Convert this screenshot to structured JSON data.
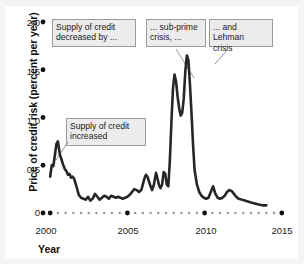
{
  "chart_data": {
    "type": "line",
    "title": "",
    "xlabel": "Year",
    "ylabel": "Price of credit risk (percent per year)",
    "xlim": [
      1999.6,
      2015.4
    ],
    "ylim": [
      0,
      2.0
    ],
    "grid": false,
    "legend": "none",
    "y_ticks": [
      "0",
      "0.5",
      "1.0",
      "1.5",
      "2.0"
    ],
    "y_tick_values": [
      0,
      0.5,
      1.0,
      1.5,
      2.0
    ],
    "x_ticks": [
      "2000",
      "2005",
      "2010",
      "2015"
    ],
    "x_tick_values": [
      2000,
      2005,
      2010,
      2015
    ],
    "x_minor_ticks": [
      2000.5,
      2001,
      2001.5,
      2002,
      2002.5,
      2003,
      2003.5,
      2004,
      2004.5,
      2005.5,
      2006,
      2006.5,
      2007,
      2007.5,
      2008,
      2008.5,
      2009,
      2009.5,
      2010.5,
      2011,
      2011.5,
      2012,
      2012.5,
      2013,
      2013.5,
      2014,
      2014.5
    ],
    "line_color": "#262626",
    "series": [
      {
        "name": "Price of credit risk",
        "x": [
          2000.0,
          2000.1,
          2000.2,
          2000.3,
          2000.4,
          2000.5,
          2000.62,
          2000.75,
          2000.85,
          2000.95,
          2001.05,
          2001.15,
          2001.25,
          2001.35,
          2001.45,
          2001.55,
          2001.7,
          2001.85,
          2002.0,
          2002.15,
          2002.3,
          2002.45,
          2002.6,
          2002.75,
          2002.9,
          2003.05,
          2003.2,
          2003.35,
          2003.5,
          2003.65,
          2003.8,
          2003.95,
          2004.1,
          2004.25,
          2004.4,
          2004.55,
          2004.7,
          2004.85,
          2005.0,
          2005.15,
          2005.3,
          2005.45,
          2005.6,
          2005.75,
          2005.9,
          2006.0,
          2006.1,
          2006.2,
          2006.3,
          2006.4,
          2006.5,
          2006.6,
          2006.72,
          2006.85,
          2006.95,
          2007.05,
          2007.15,
          2007.25,
          2007.35,
          2007.45,
          2007.55,
          2007.65,
          2007.75,
          2007.85,
          2007.95,
          2008.05,
          2008.15,
          2008.25,
          2008.35,
          2008.45,
          2008.55,
          2008.65,
          2008.75,
          2008.85,
          2008.95,
          2009.05,
          2009.15,
          2009.25,
          2009.35,
          2009.5,
          2009.65,
          2009.8,
          2009.95,
          2010.1,
          2010.25,
          2010.4,
          2010.55,
          2010.7,
          2010.85,
          2011.0,
          2011.15,
          2011.3,
          2011.45,
          2011.6,
          2011.75,
          2011.9,
          2012.05,
          2012.2,
          2012.4,
          2012.6,
          2012.8,
          2013.0,
          2013.25,
          2013.5,
          2013.75,
          2014.0
        ],
        "values": [
          0.38,
          0.5,
          0.49,
          0.6,
          0.72,
          0.75,
          0.62,
          0.55,
          0.5,
          0.46,
          0.44,
          0.4,
          0.41,
          0.37,
          0.38,
          0.36,
          0.28,
          0.19,
          0.16,
          0.15,
          0.14,
          0.17,
          0.13,
          0.15,
          0.2,
          0.17,
          0.14,
          0.16,
          0.18,
          0.17,
          0.15,
          0.18,
          0.17,
          0.16,
          0.17,
          0.16,
          0.15,
          0.16,
          0.17,
          0.19,
          0.22,
          0.25,
          0.24,
          0.22,
          0.24,
          0.3,
          0.36,
          0.4,
          0.38,
          0.33,
          0.28,
          0.24,
          0.3,
          0.42,
          0.36,
          0.29,
          0.26,
          0.3,
          0.43,
          0.41,
          0.3,
          0.28,
          0.55,
          0.95,
          1.3,
          1.45,
          1.38,
          1.22,
          1.1,
          1.02,
          1.05,
          1.2,
          1.48,
          1.65,
          1.6,
          1.35,
          1.05,
          0.72,
          0.45,
          0.3,
          0.22,
          0.18,
          0.16,
          0.15,
          0.16,
          0.22,
          0.28,
          0.2,
          0.16,
          0.15,
          0.16,
          0.18,
          0.22,
          0.24,
          0.23,
          0.2,
          0.17,
          0.15,
          0.14,
          0.13,
          0.12,
          0.11,
          0.1,
          0.09,
          0.08,
          0.08
        ]
      }
    ],
    "annotations": [
      {
        "id": "supply-decreased",
        "text_line1": "Supply of credit",
        "text_line2": "decreased by ...",
        "has_leader": false
      },
      {
        "id": "subprime-crisis",
        "text_line1": "... sub-prime",
        "text_line2": "crisis, ...",
        "has_leader": true
      },
      {
        "id": "lehman-crisis",
        "text_line1": "... and Lehman",
        "text_line2": "crisis",
        "has_leader": true
      },
      {
        "id": "supply-increased",
        "text_line1": "Supply of credit",
        "text_line2": "increased",
        "has_leader": true
      }
    ]
  }
}
